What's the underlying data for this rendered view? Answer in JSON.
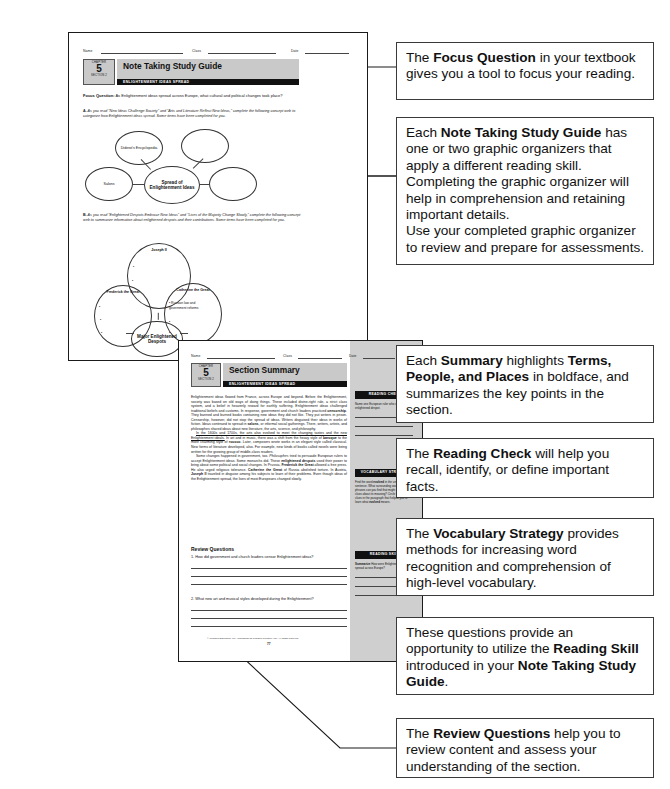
{
  "callouts": [
    {
      "name": "focus-question-callout",
      "segments": [
        {
          "t": "The ",
          "b": false
        },
        {
          "t": "Focus Question",
          "b": true
        },
        {
          "t": " in your textbook gives you a tool to focus your reading.",
          "b": false
        }
      ]
    },
    {
      "name": "note-taking-study-guide-callout",
      "segments": [
        {
          "t": "Each ",
          "b": false
        },
        {
          "t": "Note Taking Study Guide",
          "b": true
        },
        {
          "t": " has one or two graphic organizers that apply a different reading skill. Completing the graphic organizer will help in comprehension and retaining important details.\nUse your completed graphic organizer to review and prepare for assessments.",
          "b": false
        }
      ]
    },
    {
      "name": "summary-callout",
      "segments": [
        {
          "t": "Each ",
          "b": false
        },
        {
          "t": "Summary",
          "b": true
        },
        {
          "t": " highlights ",
          "b": false
        },
        {
          "t": "Terms, People, and Places",
          "b": true
        },
        {
          "t": " in boldface, and summarizes the key points in the section.",
          "b": false
        }
      ]
    },
    {
      "name": "reading-check-callout",
      "segments": [
        {
          "t": "The ",
          "b": false
        },
        {
          "t": "Reading Check",
          "b": true
        },
        {
          "t": " will help you recall, identify, or define important facts.",
          "b": false
        }
      ]
    },
    {
      "name": "vocabulary-strategy-callout",
      "segments": [
        {
          "t": "The ",
          "b": false
        },
        {
          "t": "Vocabulary Strategy",
          "b": true
        },
        {
          "t": " provides methods for increasing word recognition and comprehension of high-level vocabulary.",
          "b": false
        }
      ]
    },
    {
      "name": "reading-skill-callout",
      "segments": [
        {
          "t": "These questions provide an opportunity to utilize the ",
          "b": false
        },
        {
          "t": "Reading Skill",
          "b": true
        },
        {
          "t": " introduced in your ",
          "b": false
        },
        {
          "t": "Note Taking Study Guide",
          "b": true
        },
        {
          "t": ".",
          "b": false
        }
      ]
    },
    {
      "name": "review-questions-callout",
      "segments": [
        {
          "t": "The ",
          "b": false
        },
        {
          "t": "Review Questions",
          "b": true
        },
        {
          "t": " help you to review content and assess your understanding of the section.",
          "b": false
        }
      ]
    }
  ],
  "page1": {
    "name_label": "Name",
    "class_label": "Class",
    "date_label": "Date",
    "chapter_word": "CHAPTER",
    "chapter_number": "5",
    "section_word": "SECTION 2",
    "title": "Note Taking Study Guide",
    "subtitle": "ENLIGHTENMENT IDEAS SPREAD",
    "focus_label": "Focus Question:",
    "focus_text": " As Enlightenment ideas spread across Europe, what cultural and political changes took place?",
    "part_a_letter": "A.",
    "part_a_text": "As you read “New Ideas Challenge Society” and “Arts and Literature Reflect New Ideas,” complete the following concept web to categorize how Enlightenment ideas spread. Some items have been completed for you.",
    "web_a": {
      "center": "Spread of Enlightenment Ideas",
      "nodes": [
        "Diderot's Encyclopedia",
        "",
        "Salons",
        ""
      ]
    },
    "part_b_letter": "B.",
    "part_b_text": "As you read “Enlightened Despots Embrace New Ideas” and “Lives of the Majority Change Slowly,” complete the following concept web to summarize information about enlightened despots and their contributions. Some items have been completed for you.",
    "web_b": {
      "center": "Major Enlightened Despots",
      "top": "Joseph II",
      "left": "Frederick the Great",
      "right": "Catherine the Great",
      "right_bullet": "Russian law and government reforms"
    }
  },
  "page2": {
    "name_label": "Name",
    "class_label": "Class",
    "date_label": "Date",
    "chapter_word": "CHAPTER",
    "chapter_number": "5",
    "section_word": "SECTION 2",
    "title": "Section Summary",
    "subtitle": "ENLIGHTENMENT IDEAS SPREAD",
    "paragraphs": [
      [
        {
          "t": "Enlightenment ideas flowed from France, across Europe and beyond. Before the Enlightenment, society was based on old ways of doing things. These included divine-right rule, a strict class system, and a belief in heavenly reward for earthly suffering. Enlightenment ideas challenged traditional beliefs and customs. In response, government and church leaders practiced ",
          "s": "n"
        },
        {
          "t": "censorship",
          "s": "b"
        },
        {
          "t": ". They banned and burned books containing new ideas they did not like. They put writers in prison. Censorship, however, did not stop the spread of ideas. Writers disguised their ideas in works of fiction. Ideas continued to spread in ",
          "s": "n"
        },
        {
          "t": "salons",
          "s": "b"
        },
        {
          "t": ", or informal social gatherings. There, writers, artists, and philosophes shared ideas about new literature, the arts, science, and philosophy.",
          "s": "n"
        }
      ],
      [
        {
          "t": "In the 1600s and 1700s, the arts also evolved to meet the changing tastes and the new Enlightenment ideals.",
          "s": "u"
        },
        {
          "t": " In art and in music, there was a shift from the heavy style of ",
          "s": "n"
        },
        {
          "t": "baroque",
          "s": "b"
        },
        {
          "t": " to the more charming style of ",
          "s": "n"
        },
        {
          "t": "rococo",
          "s": "b"
        },
        {
          "t": ". Later, composers wrote works in an elegant style called classical. New forms of literature developed, also. For example, new kinds of books called novels were being written for the growing group of middle-class readers.",
          "s": "n"
        }
      ],
      [
        {
          "t": "Some changes happened in government, too. ",
          "s": "n"
        },
        {
          "t": "Philosophes",
          "s": "i"
        },
        {
          "t": " tried to persuade European rulers to accept Enlightenment ideas. Some monarchs did. These ",
          "s": "n"
        },
        {
          "t": "enlightened despots",
          "s": "b"
        },
        {
          "t": " used their power to bring about some political and social changes. In Prussia, ",
          "s": "n"
        },
        {
          "t": "Frederick the Great",
          "s": "b"
        },
        {
          "t": " allowed a free press. He also urged religious tolerance. ",
          "s": "n"
        },
        {
          "t": "Catherine the Great",
          "s": "b"
        },
        {
          "t": " of Russia abolished torture. In Austria, ",
          "s": "n"
        },
        {
          "t": "Joseph II",
          "s": "b"
        },
        {
          "t": " traveled in disguise among his subjects to learn of their problems. Even though ideas of the Enlightenment spread, the lives of most Europeans changed slowly.",
          "s": "n"
        }
      ]
    ],
    "review_heading": "Review Questions",
    "questions": [
      {
        "num": "1.",
        "text": "How did government and church leaders censor Enlightenment ideas?"
      },
      {
        "num": "2.",
        "text": "What new art and musical styles developed during the Enlightenment?"
      }
    ],
    "footer": "© Pearson Education, Inc., publishing as Pearson Prentice Hall. All rights reserved.",
    "page_number": "77",
    "sidebar": [
      {
        "heading": "READING CHECK",
        "body": [
          {
            "t": "Name one European ruler who was an enlightened despot.",
            "s": "n"
          }
        ],
        "lines": 3
      },
      {
        "heading": "VOCABULARY STRATEGY",
        "body": [
          {
            "t": "Find the word ",
            "s": "n"
          },
          {
            "t": "evolved",
            "s": "b"
          },
          {
            "t": " in the underlined sentence. What surrounding words or phrases can you find that might give you clues about its meaning? Circle the context clues in the paragraph that helped you to learn what ",
            "s": "n"
          },
          {
            "t": "evolved",
            "s": "b"
          },
          {
            "t": " means.",
            "s": "n"
          }
        ],
        "lines": 0
      },
      {
        "heading": "READING SKILL",
        "body": [
          {
            "t": "Summarize",
            "s": "b"
          },
          {
            "t": " How were Enlightenment ideas spread across Europe?",
            "s": "n"
          }
        ],
        "lines": 3
      }
    ]
  }
}
